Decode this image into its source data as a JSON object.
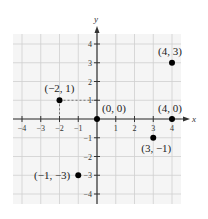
{
  "diagram": {
    "type": "coordinate-plane",
    "axes": {
      "x_label": "x",
      "y_label": "y",
      "x_range": [
        -4,
        4
      ],
      "y_range": [
        -4,
        4
      ],
      "x_ticks": [
        -4,
        -3,
        -2,
        -1,
        1,
        2,
        3,
        4
      ],
      "y_ticks": [
        4,
        3,
        2,
        1,
        -1,
        -2,
        -3,
        -4
      ],
      "x_tick_labels": [
        "−4",
        "−3",
        "−2",
        "−1",
        "1",
        "2",
        "3",
        "4"
      ],
      "y_tick_labels": [
        "4",
        "3",
        "2",
        "1",
        "−1",
        "−2",
        "−3",
        "−4"
      ]
    },
    "grid": true,
    "points": [
      {
        "label": "(−2, 1)",
        "x": -2,
        "y": 1
      },
      {
        "label": "(4, 3)",
        "x": 4,
        "y": 3
      },
      {
        "label": "(0, 0)",
        "x": 0,
        "y": 0
      },
      {
        "label": "(4, 0)",
        "x": 4,
        "y": 0
      },
      {
        "label": "(3, −1)",
        "x": 3,
        "y": -1
      },
      {
        "label": "(−1, −3)",
        "x": -1,
        "y": -3
      }
    ],
    "dashed_guides": [
      {
        "from": [
          -2,
          1
        ],
        "to": [
          0,
          1
        ],
        "note": "horizontal dashed guide"
      },
      {
        "from": [
          -2,
          1
        ],
        "to": [
          -2,
          0
        ],
        "note": "vertical dashed guide"
      }
    ],
    "colors": {
      "grid": "#c8c8c8",
      "grid_bg": "#f4f4f4",
      "axis": "#333333",
      "point": "#000000"
    }
  }
}
